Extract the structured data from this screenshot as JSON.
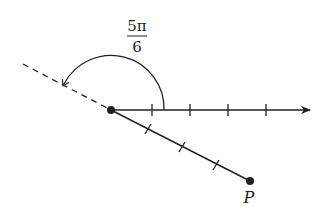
{
  "diagram": {
    "type": "polar-angle",
    "angle_label": {
      "numerator": "5π",
      "denominator": "6"
    },
    "point_label": "P",
    "polar_axis_ticks": 4,
    "segment_ticks": 3,
    "colors": {
      "stroke": "#222222",
      "background": "#ffffff"
    }
  }
}
